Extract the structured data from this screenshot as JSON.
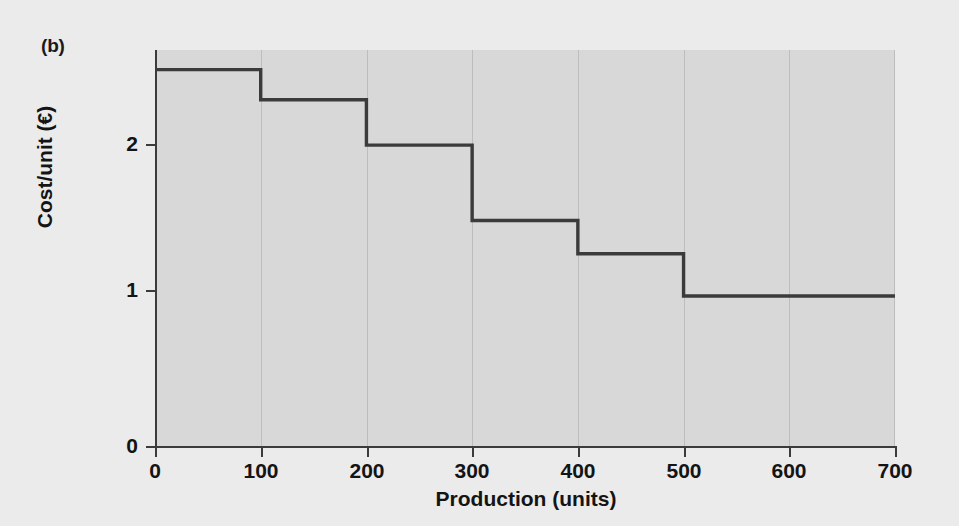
{
  "figure": {
    "panel_label": "(b)",
    "background_color": "#ebebeb",
    "plot_background_color": "#d8d8d8",
    "line_color": "#3b3b3b",
    "gridline_color": "#bdbdbd"
  },
  "chart_data": {
    "type": "line",
    "subtype": "step-post",
    "title": "",
    "panel": "(b)",
    "xlabel": "Production (units)",
    "ylabel": "Cost/unit (€)",
    "xlim": [
      0,
      700
    ],
    "ylim": [
      0,
      2.63
    ],
    "xticks": [
      0,
      100,
      200,
      300,
      400,
      500,
      600,
      700
    ],
    "xticklabels": [
      "0",
      "100",
      "200",
      "300",
      "400",
      "500",
      "600",
      "700"
    ],
    "yticks": [
      0,
      1,
      2
    ],
    "yticklabels": [
      "0",
      "1",
      "2"
    ],
    "grid": "vertical",
    "legend": "none",
    "series": [
      {
        "name": "Cost per unit",
        "steps": [
          {
            "x_start": 0,
            "x_end": 100,
            "y": 2.5
          },
          {
            "x_start": 100,
            "x_end": 200,
            "y": 2.3
          },
          {
            "x_start": 200,
            "x_end": 300,
            "y": 2.0
          },
          {
            "x_start": 300,
            "x_end": 400,
            "y": 1.5
          },
          {
            "x_start": 400,
            "x_end": 500,
            "y": 1.28
          },
          {
            "x_start": 500,
            "x_end": 700,
            "y": 1.0
          }
        ],
        "x": [
          0,
          100,
          100,
          200,
          200,
          300,
          300,
          400,
          400,
          500,
          500,
          700
        ],
        "y": [
          2.5,
          2.5,
          2.3,
          2.3,
          2.0,
          2.0,
          1.5,
          1.5,
          1.28,
          1.28,
          1.0,
          1.0
        ]
      }
    ]
  }
}
